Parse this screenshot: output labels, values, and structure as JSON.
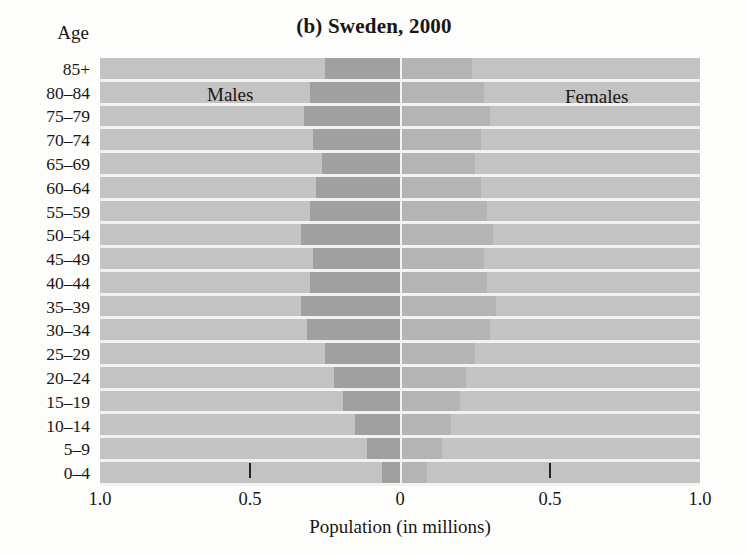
{
  "chart_data": {
    "type": "bar",
    "subtype": "population-pyramid",
    "title": "(b) Sweden, 2000",
    "xlabel": "Population (in millions)",
    "ylabel": "Age",
    "grid": false,
    "legend_position": "in-plot",
    "xlim": [
      -1.0,
      1.0
    ],
    "xticks": [
      -1.0,
      -0.5,
      0,
      0.5,
      1.0
    ],
    "xticklabels": [
      "1.0",
      "0.5",
      "0",
      "0.5",
      "1.0"
    ],
    "categories": [
      "85+",
      "80–84",
      "75–79",
      "70–74",
      "65–69",
      "60–64",
      "55–59",
      "50–54",
      "45–49",
      "40–44",
      "35–39",
      "30–34",
      "25–29",
      "20–24",
      "15–19",
      "10–14",
      "5–9",
      "0–4"
    ],
    "series": [
      {
        "name": "Males",
        "color": "#a0a0a0",
        "values": [
          0.06,
          0.11,
          0.15,
          0.19,
          0.22,
          0.25,
          0.31,
          0.33,
          0.3,
          0.29,
          0.33,
          0.3,
          0.28,
          0.26,
          0.29,
          0.32,
          0.3,
          0.25
        ]
      },
      {
        "name": "Females",
        "color": "#b4b4b4",
        "values": [
          0.09,
          0.14,
          0.17,
          0.2,
          0.22,
          0.25,
          0.3,
          0.32,
          0.29,
          0.28,
          0.31,
          0.29,
          0.27,
          0.25,
          0.27,
          0.3,
          0.28,
          0.24
        ]
      }
    ]
  },
  "labels": {
    "age_heading": "Age",
    "males": "Males",
    "females": "Females"
  },
  "colors": {
    "plot_background": "#c3c3c3",
    "male_bar": "#a0a0a0",
    "female_bar": "#b4b4b4",
    "gridline": "#f2f2f0",
    "text": "#1a1613"
  }
}
